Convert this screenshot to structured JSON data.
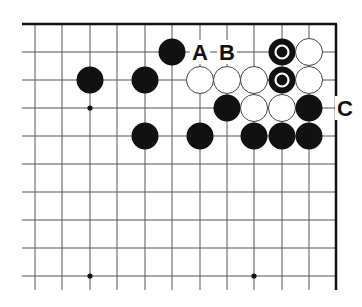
{
  "diagram": {
    "type": "go-board-fragment",
    "grid": {
      "columns_x": [
        35,
        62,
        90,
        117,
        145,
        172,
        200,
        227,
        254,
        282,
        309,
        336
      ],
      "rows_y": [
        24,
        52,
        80,
        108,
        136,
        164,
        192,
        220,
        248,
        276
      ],
      "line_left": 22,
      "line_bottom": 290,
      "top_edge_y": 24,
      "right_edge_x": 336,
      "line_color": "#555555",
      "edge_color": "#111111"
    },
    "star_points": [
      {
        "x": 90,
        "y": 108
      },
      {
        "x": 90,
        "y": 276
      },
      {
        "x": 254,
        "y": 276
      }
    ],
    "stones": [
      {
        "color": "black",
        "x": 172,
        "y": 52,
        "marked": false
      },
      {
        "color": "black",
        "x": 282,
        "y": 52,
        "marked": true
      },
      {
        "color": "white",
        "x": 309,
        "y": 52,
        "marked": false
      },
      {
        "color": "black",
        "x": 90,
        "y": 80,
        "marked": false
      },
      {
        "color": "black",
        "x": 145,
        "y": 80,
        "marked": false
      },
      {
        "color": "white",
        "x": 200,
        "y": 80,
        "marked": false
      },
      {
        "color": "white",
        "x": 227,
        "y": 80,
        "marked": false
      },
      {
        "color": "white",
        "x": 254,
        "y": 80,
        "marked": false
      },
      {
        "color": "black",
        "x": 282,
        "y": 80,
        "marked": true
      },
      {
        "color": "white",
        "x": 309,
        "y": 80,
        "marked": false
      },
      {
        "color": "black",
        "x": 227,
        "y": 108,
        "marked": false
      },
      {
        "color": "white",
        "x": 254,
        "y": 108,
        "marked": false
      },
      {
        "color": "white",
        "x": 282,
        "y": 108,
        "marked": false
      },
      {
        "color": "black",
        "x": 309,
        "y": 108,
        "marked": false
      },
      {
        "color": "black",
        "x": 145,
        "y": 136,
        "marked": false
      },
      {
        "color": "black",
        "x": 200,
        "y": 136,
        "marked": false
      },
      {
        "color": "black",
        "x": 254,
        "y": 136,
        "marked": false
      },
      {
        "color": "black",
        "x": 282,
        "y": 136,
        "marked": false
      },
      {
        "color": "black",
        "x": 309,
        "y": 136,
        "marked": false
      }
    ],
    "labels": [
      {
        "text": "A",
        "x": 200,
        "y": 52
      },
      {
        "text": "B",
        "x": 227,
        "y": 52
      },
      {
        "text": "C",
        "x": 345,
        "y": 108
      }
    ],
    "stone_radius": 13.5
  }
}
